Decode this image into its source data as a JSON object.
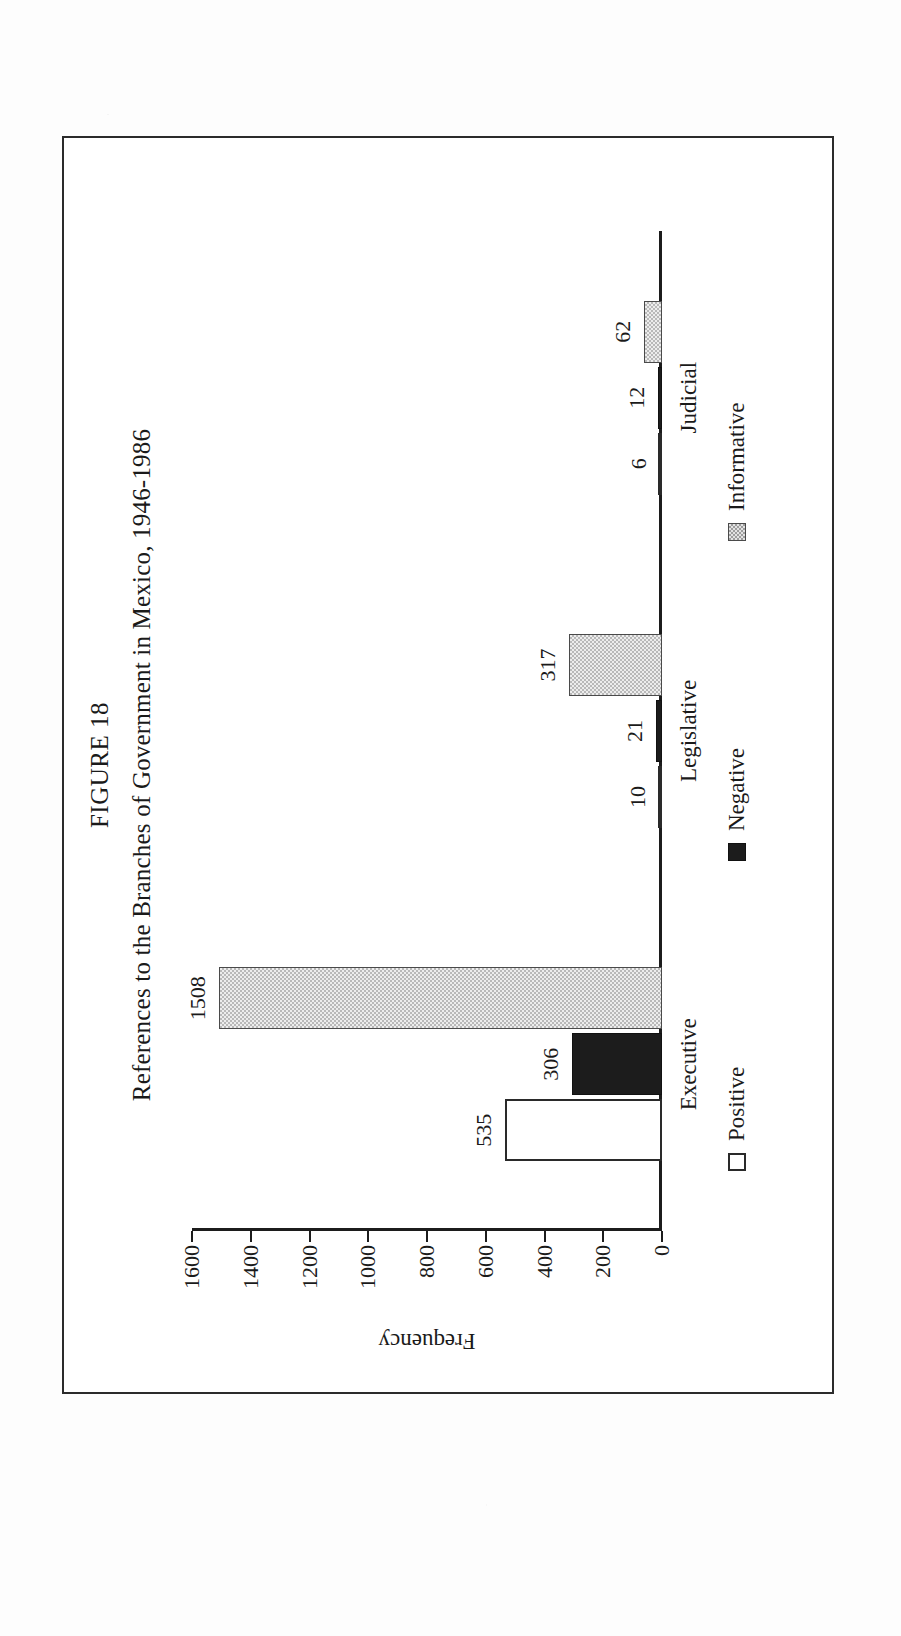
{
  "figure": {
    "number_label": "FIGURE 18",
    "title": "References to the Branches of Government in Mexico, 1946-1986"
  },
  "chart_data": {
    "type": "bar",
    "orientation": "vertical",
    "title": "References to the Branches of Government in Mexico, 1946-1986",
    "subtitle": "FIGURE 18",
    "xlabel": "",
    "ylabel": "Frequency",
    "categories": [
      "Executive",
      "Legislative",
      "Judicial"
    ],
    "series": [
      {
        "name": "Positive",
        "values": [
          535,
          10,
          6
        ],
        "swatch": "white-square"
      },
      {
        "name": "Negative",
        "values": [
          306,
          21,
          12
        ],
        "swatch": "black-square"
      },
      {
        "name": "Informative",
        "values": [
          1508,
          317,
          62
        ],
        "swatch": "hatched-gray-square"
      }
    ],
    "ylim": [
      0,
      1600
    ],
    "yticks": [
      0,
      200,
      400,
      600,
      800,
      1000,
      1200,
      1400,
      1600
    ],
    "ytick_labels": [
      "0",
      "200",
      "400",
      "600",
      "800",
      "1000",
      "1200",
      "1400",
      "1600"
    ],
    "data_labels": [
      "535",
      "306",
      "1508",
      "10",
      "21",
      "317",
      "6",
      "12",
      "62"
    ],
    "grid": false,
    "legend_position": "bottom",
    "legend_entries": [
      "Positive",
      "Negative",
      "Informative"
    ],
    "colors": {
      "positive": "#ffffff",
      "negative": "#1c1c1c",
      "informative": "#b9b9b9",
      "axis": "#1c1c1c",
      "frame": "#2b2b2b",
      "page": "#fdfdfd"
    }
  }
}
